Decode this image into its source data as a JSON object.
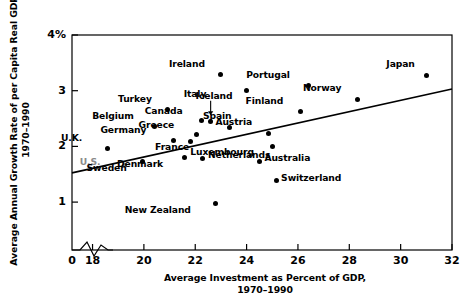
{
  "chart_data": {
    "type": "scatter",
    "title": "",
    "xlabel": "Average Investment as Percent of GDP, 1970–1990",
    "xlabel_line1": "Average Investment as Percent of GDP,",
    "xlabel_line2": "1970–1990",
    "ylabel": "Average Annual Growth Rate of per Capita Real GDP, 1970–1990",
    "ylabel_line1": "Average Annual Growth Rate of per Capita Real GDP,",
    "ylabel_line2": "1970–1990",
    "xlim": [
      17.2,
      32
    ],
    "ylim": [
      0,
      4
    ],
    "xticks": [
      18,
      20,
      22,
      24,
      26,
      28,
      30,
      32
    ],
    "xtick_labels": [
      "18",
      "20",
      "22",
      "24",
      "26",
      "28",
      "30",
      "32"
    ],
    "yticks": [
      1,
      2,
      3,
      4
    ],
    "ytick_labels": [
      "1",
      "2",
      "3",
      "4%"
    ],
    "origin_label": "0",
    "axis_break": true,
    "grid": false,
    "legend": false,
    "trendline": {
      "x0": 17.2,
      "y0": 1.525,
      "x1": 32.0,
      "y1": 3.03
    },
    "points": [
      {
        "name": "U.K.",
        "x": 18.6,
        "y": 1.97,
        "label_dx": -30,
        "label_dy": -12,
        "muted": false
      },
      {
        "name": "U.S.",
        "x": 19.25,
        "y": 1.66,
        "label_dx": -28,
        "label_dy": -5,
        "muted": true
      },
      {
        "name": "Sweden",
        "x": 19.95,
        "y": 1.72,
        "label_dx": -20,
        "label_dy": 4,
        "muted": false
      },
      {
        "name": "Belgium",
        "x": 20.4,
        "y": 2.35,
        "label_dx": -24,
        "label_dy": -13,
        "muted": false
      },
      {
        "name": "Turkey",
        "x": 20.9,
        "y": 2.66,
        "label_dx": -19,
        "label_dy": -13,
        "muted": false
      },
      {
        "name": "Germany",
        "x": 21.15,
        "y": 2.11,
        "label_dx": -31,
        "label_dy": -12,
        "muted": false
      },
      {
        "name": "Denmark",
        "x": 21.6,
        "y": 1.8,
        "label_dx": -26,
        "label_dy": 4,
        "muted": false
      },
      {
        "name": "France",
        "x": 21.8,
        "y": 2.09,
        "label_dx": -5,
        "label_dy": 4,
        "muted": false
      },
      {
        "name": "Greece",
        "x": 22.05,
        "y": 2.21,
        "label_dx": -26,
        "label_dy": -12,
        "muted": false
      },
      {
        "name": "Netherlands",
        "x": 22.3,
        "y": 1.79,
        "label_dx": 5,
        "label_dy": -5,
        "muted": false
      },
      {
        "name": "Canada",
        "x": 22.25,
        "y": 2.46,
        "label_dx": -23,
        "label_dy": -12,
        "muted": false
      },
      {
        "name": "Italy",
        "x": 22.6,
        "y": 2.44,
        "label_dx": -8,
        "label_dy": -30,
        "muted": false
      },
      {
        "name": "New Zealand",
        "x": 22.8,
        "y": 0.97,
        "label_dx": -29,
        "label_dy": 4,
        "muted": false
      },
      {
        "name": "Ireland",
        "x": 23.0,
        "y": 3.29,
        "label_dx": -20,
        "label_dy": -13,
        "muted": false
      },
      {
        "name": "Spain",
        "x": 23.35,
        "y": 2.34,
        "label_dx": -2,
        "label_dy": -13,
        "muted": false
      },
      {
        "name": "Iceland",
        "x": 24.0,
        "y": 3.01,
        "label_dx": -18,
        "label_dy": 4,
        "muted": false
      },
      {
        "name": "Australia",
        "x": 24.5,
        "y": 1.73,
        "label_dx": 5,
        "label_dy": -5,
        "muted": false
      },
      {
        "name": "Austria",
        "x": 24.85,
        "y": 2.24,
        "label_dx": -20,
        "label_dy": -13,
        "muted": false
      },
      {
        "name": "Luxembourg",
        "x": 25.0,
        "y": 2.0,
        "label_dx": -22,
        "label_dy": 4,
        "muted": false
      },
      {
        "name": "Switzerland",
        "x": 25.15,
        "y": 1.38,
        "label_dx": 5,
        "label_dy": -5,
        "muted": false
      },
      {
        "name": "Finland",
        "x": 26.1,
        "y": 2.62,
        "label_dx": -21,
        "label_dy": -13,
        "muted": false
      },
      {
        "name": "Portugal",
        "x": 26.4,
        "y": 3.09,
        "label_dx": -22,
        "label_dy": -13,
        "muted": false
      },
      {
        "name": "Norway",
        "x": 28.3,
        "y": 2.85,
        "label_dx": -20,
        "label_dy": -13,
        "muted": false
      },
      {
        "name": "Japan",
        "x": 31.0,
        "y": 3.28,
        "label_dx": -16,
        "label_dy": -13,
        "muted": false
      }
    ],
    "italy_arrow": {
      "from_x": 22.6,
      "from_y": 2.82,
      "to_x": 22.6,
      "to_y": 2.56
    }
  }
}
